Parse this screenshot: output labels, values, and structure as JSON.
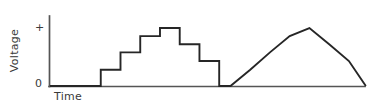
{
  "figure": {
    "title": "",
    "background_color": "#ffffff",
    "width": 371,
    "height": 109
  },
  "axes": {
    "y_label": "Voltage",
    "x_label": "Time",
    "y_ticks": [
      {
        "name": "plus",
        "label": "+",
        "value": 1.0,
        "pixel_y": 28
      },
      {
        "name": "zero",
        "label": "0",
        "value": 0.0,
        "pixel_y": 86
      }
    ],
    "x_ticks": [],
    "axis_color": "#555555",
    "axis_line_width": 1.6,
    "origin_pixel": {
      "x": 49,
      "y": 86
    },
    "y_axis_top_pixel": 16,
    "x_axis_right_pixel": 365
  },
  "waveform": {
    "line_color": "#262626",
    "line_width": 1.9,
    "description": "Two identical symmetric staircase pulses rising in four levels and falling back to zero"
  },
  "chart_data": {
    "type": "line",
    "title": "",
    "subtitle": "",
    "xlabel": "Time",
    "ylabel": "Voltage",
    "xlim": [
      0,
      100
    ],
    "ylim": [
      0,
      1.15
    ],
    "grid": false,
    "legend": null,
    "annotations": [],
    "y_tick_labels": [
      "0",
      "+"
    ],
    "y_tick_values": [
      0,
      1.0
    ],
    "x_tick_labels": [],
    "step_shape": "hvh",
    "series": [
      {
        "name": "Voltage staircase waveform",
        "color": "#262626",
        "x": [
          0,
          18,
          18,
          25,
          25,
          32,
          32,
          39,
          39,
          46,
          46,
          53,
          53,
          60,
          60,
          64,
          64,
          71,
          71,
          78,
          78,
          85,
          85,
          92,
          92,
          99,
          99,
          106,
          106,
          112
        ],
        "y": [
          0,
          0,
          0.28,
          0.28,
          0.58,
          0.58,
          0.86,
          0.86,
          1.0,
          1.0,
          0.72,
          0.72,
          0.43,
          0.43,
          0,
          0,
          0,
          0.28,
          0.28,
          0.58,
          0.58,
          0.86,
          0.86,
          1.0,
          1.0,
          0.72,
          0.72,
          0.43,
          0.43,
          0
        ]
      }
    ],
    "pulses": [
      {
        "name": "pulse-1",
        "levels": [
          0.28,
          0.58,
          0.86,
          1.0,
          0.72,
          0.43
        ],
        "start_x": 18,
        "end_x": 60
      },
      {
        "name": "pulse-2",
        "levels": [
          0.28,
          0.58,
          0.86,
          1.0,
          0.72,
          0.43
        ],
        "start_x": 64,
        "end_x": 106
      }
    ]
  }
}
